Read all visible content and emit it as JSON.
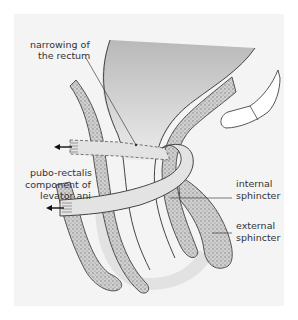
{
  "diagram": {
    "labels": {
      "narrowing_line1": "narrowing of",
      "narrowing_line2": "the rectum",
      "puborectalis_line1": "pubo-rectalis",
      "puborectalis_line2": "component of",
      "puborectalis_line3": "levator ani",
      "internal_line1": "internal",
      "internal_line2": "sphincter",
      "external_line1": "external",
      "external_line2": "sphincter"
    },
    "colors": {
      "panel_bg": "#f4f4f4",
      "rectum_fill": "#c8c8c8",
      "muscle_fill": "#bdbdbd",
      "sling_fill": "#e3e3e3",
      "outline": "#444444",
      "shadow": "#dcdcdc"
    }
  }
}
